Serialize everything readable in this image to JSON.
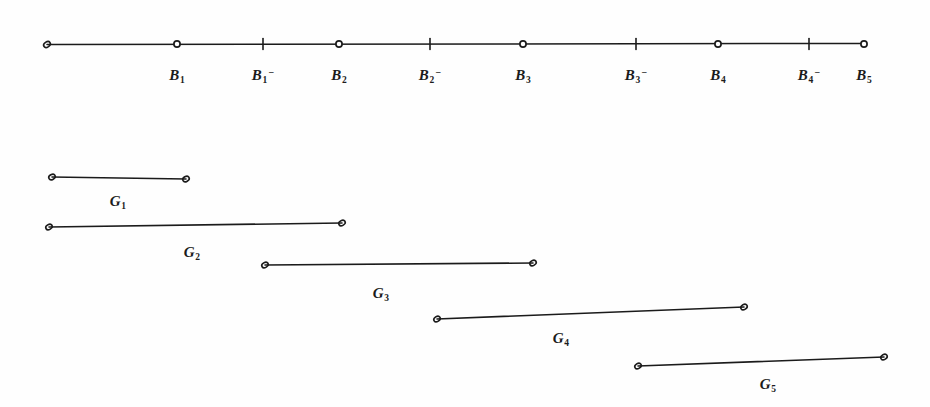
{
  "figure": {
    "background_color": "#fefefe",
    "ink_color": "#1b1b1b",
    "width": 930,
    "height": 407
  },
  "chart_data": {
    "type": "diagram",
    "title": "",
    "xlabel": "",
    "ylabel": "",
    "axis": {
      "name": "breakpoint-axis",
      "y": 44,
      "x_start": 47,
      "x_end": 864,
      "points": [
        {
          "label": "B",
          "sub": "1",
          "sup": "",
          "x": 177,
          "marker": "circle"
        },
        {
          "label": "B",
          "sub": "1",
          "sup": "−",
          "x": 263,
          "marker": "tick"
        },
        {
          "label": "B",
          "sub": "2",
          "sup": "",
          "x": 339,
          "marker": "circle"
        },
        {
          "label": "B",
          "sub": "2",
          "sup": "−",
          "x": 430,
          "marker": "tick"
        },
        {
          "label": "B",
          "sub": "3",
          "sup": "",
          "x": 523,
          "marker": "circle"
        },
        {
          "label": "B",
          "sub": "3",
          "sup": "−",
          "x": 636,
          "marker": "tick"
        },
        {
          "label": "B",
          "sub": "4",
          "sup": "",
          "x": 718,
          "marker": "circle"
        },
        {
          "label": "B",
          "sub": "4",
          "sup": "−",
          "x": 809,
          "marker": "tick"
        },
        {
          "label": "B",
          "sub": "5",
          "sup": "",
          "x": 864,
          "marker": "circle"
        }
      ],
      "label_y": 68
    },
    "segments": [
      {
        "label": "G",
        "sub": "1",
        "x1": 52,
        "y1": 177,
        "x2": 186,
        "y2": 179,
        "label_x": 118,
        "label_y": 194
      },
      {
        "label": "G",
        "sub": "2",
        "x1": 49,
        "y1": 227,
        "x2": 342,
        "y2": 223,
        "label_x": 192,
        "label_y": 245
      },
      {
        "label": "G",
        "sub": "3",
        "x1": 265,
        "y1": 265,
        "x2": 533,
        "y2": 263,
        "label_x": 381,
        "label_y": 286
      },
      {
        "label": "G",
        "sub": "4",
        "x1": 437,
        "y1": 319,
        "x2": 744,
        "y2": 307,
        "label_x": 561,
        "label_y": 331
      },
      {
        "label": "G",
        "sub": "5",
        "x1": 638,
        "y1": 366,
        "x2": 884,
        "y2": 357,
        "label_x": 768,
        "label_y": 377
      }
    ]
  }
}
